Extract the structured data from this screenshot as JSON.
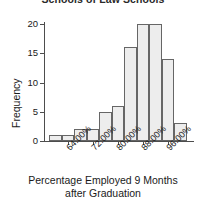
{
  "chart_data": {
    "type": "bar",
    "title": "Schools of Law Schools",
    "xlabel": "Percentage Employed 9 Months after Graduation",
    "xlabel_line1": "Percentage Employed 9 Months",
    "xlabel_line2": "after Graduation",
    "ylabel": "Frequency",
    "categories": [
      "60.00%",
      "64.00%",
      "68.00%",
      "72.00%",
      "76.00%",
      "80.00%",
      "84.00%",
      "88.00%",
      "92.00%",
      "96.00%",
      "100.00%"
    ],
    "values": [
      1,
      1,
      2,
      2,
      5,
      6,
      16,
      20,
      20,
      14,
      3
    ],
    "bin_centers": [
      62,
      66,
      70,
      74,
      78,
      82,
      86,
      90,
      94,
      98,
      102
    ],
    "xtick_labels": [
      "64.00%",
      "72.00%",
      "80.00%",
      "88.00%",
      "96.00%"
    ],
    "xtick_values": [
      66,
      74,
      82,
      90,
      98
    ],
    "ytick_labels": [
      "0",
      "5",
      "10",
      "15",
      "20"
    ],
    "ytick_values": [
      0,
      5,
      10,
      15,
      20
    ],
    "ylim": [
      0,
      20
    ],
    "grid": false,
    "legend": false,
    "bar_fill_color": "#ededed",
    "bar_border_color": "#666666",
    "axis_color": "#4d4d4d"
  }
}
